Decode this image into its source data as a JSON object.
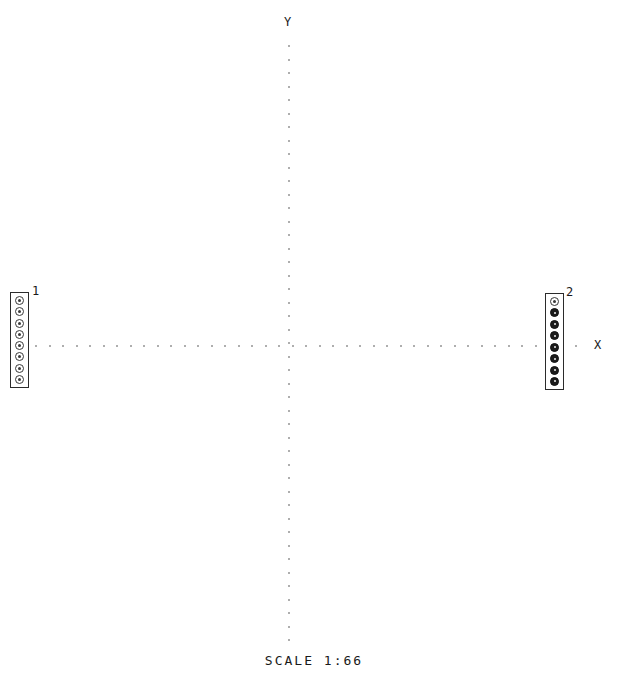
{
  "canvas": {
    "width": 628,
    "height": 692,
    "background": "#ffffff",
    "ink": "#1a1a1a",
    "axis_color": "#aeaeae"
  },
  "axes": {
    "y_label": "Y",
    "x_label": "X",
    "origin_x": 288,
    "origin_y": 345,
    "dot_spacing": 13.5,
    "x_extent": [
      35,
      578
    ],
    "y_extent": [
      45,
      645
    ],
    "style": "dotted"
  },
  "footer": {
    "scale_text": "SCALE  1:66",
    "scale_label": "SCALE",
    "scale_ratio": "1:66"
  },
  "parts": [
    {
      "label": "1",
      "x": 10,
      "y": 292,
      "width": 19,
      "height": 96,
      "label_x": 32,
      "label_y": 285,
      "node_count": 8,
      "node_style": "open",
      "nodes": [
        {
          "filled": false
        },
        {
          "filled": false
        },
        {
          "filled": false
        },
        {
          "filled": false
        },
        {
          "filled": false
        },
        {
          "filled": false
        },
        {
          "filled": false
        },
        {
          "filled": false
        }
      ]
    },
    {
      "label": "2",
      "x": 545,
      "y": 293,
      "width": 19,
      "height": 97,
      "label_x": 566,
      "label_y": 286,
      "node_count": 8,
      "node_style": "filled",
      "nodes": [
        {
          "filled": false
        },
        {
          "filled": true
        },
        {
          "filled": true
        },
        {
          "filled": true
        },
        {
          "filled": true
        },
        {
          "filled": true
        },
        {
          "filled": true
        },
        {
          "filled": true
        }
      ]
    }
  ],
  "chart_data": {
    "type": "scatter",
    "title": "",
    "xlabel": "X",
    "ylabel": "Y",
    "annotations": [
      "SCALE  1:66"
    ],
    "series": [
      {
        "name": "1",
        "marker": "open-circle",
        "count": 8,
        "x": [
          -278,
          -278,
          -278,
          -278,
          -278,
          -278,
          -278,
          -278
        ],
        "y": [
          46,
          33,
          21,
          8,
          -4,
          -17,
          -29,
          -42
        ]
      },
      {
        "name": "2",
        "marker": "filled-circle",
        "count": 8,
        "x": [
          257,
          257,
          257,
          257,
          257,
          257,
          257,
          257
        ],
        "y": [
          45,
          32,
          20,
          7,
          -5,
          -18,
          -30,
          -43
        ]
      }
    ],
    "grid": false,
    "legend": "none"
  }
}
